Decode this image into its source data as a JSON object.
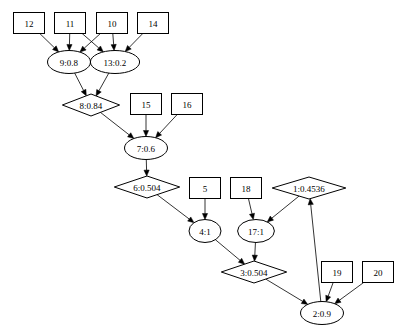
{
  "diagram": {
    "type": "directed-graph",
    "nodes": [
      {
        "id": "12",
        "label": "12",
        "shape": "box",
        "cx": 29,
        "cy": 23
      },
      {
        "id": "11",
        "label": "11",
        "shape": "box",
        "cx": 70,
        "cy": 23
      },
      {
        "id": "10",
        "label": "10",
        "shape": "box",
        "cx": 112,
        "cy": 23
      },
      {
        "id": "14",
        "label": "14",
        "shape": "box",
        "cx": 153,
        "cy": 23
      },
      {
        "id": "9",
        "label": "9:0.8",
        "shape": "ellipse",
        "cx": 69,
        "cy": 62
      },
      {
        "id": "13",
        "label": "13:0.2",
        "shape": "ellipse",
        "cx": 115,
        "cy": 62
      },
      {
        "id": "8",
        "label": "8:0.84",
        "shape": "diamond",
        "cx": 91,
        "cy": 105
      },
      {
        "id": "15",
        "label": "15",
        "shape": "box",
        "cx": 146,
        "cy": 104
      },
      {
        "id": "16",
        "label": "16",
        "shape": "box",
        "cx": 187,
        "cy": 104
      },
      {
        "id": "7",
        "label": "7:0.6",
        "shape": "ellipse",
        "cx": 146,
        "cy": 148
      },
      {
        "id": "6",
        "label": "6:0.504",
        "shape": "diamond",
        "cx": 147,
        "cy": 187
      },
      {
        "id": "5",
        "label": "5",
        "shape": "box",
        "cx": 205,
        "cy": 188
      },
      {
        "id": "18",
        "label": "18",
        "shape": "box",
        "cx": 246,
        "cy": 188
      },
      {
        "id": "1",
        "label": "1:0.4536",
        "shape": "diamond",
        "cx": 309,
        "cy": 188
      },
      {
        "id": "4",
        "label": "4:1",
        "shape": "ellipse",
        "cx": 205,
        "cy": 231
      },
      {
        "id": "17",
        "label": "17:1",
        "shape": "ellipse",
        "cx": 256,
        "cy": 231
      },
      {
        "id": "3",
        "label": "3:0.504",
        "shape": "diamond",
        "cx": 254,
        "cy": 272
      },
      {
        "id": "19",
        "label": "19",
        "shape": "box",
        "cx": 337,
        "cy": 272
      },
      {
        "id": "20",
        "label": "20",
        "shape": "box",
        "cx": 378,
        "cy": 272
      },
      {
        "id": "2",
        "label": "2:0.9",
        "shape": "ellipse",
        "cx": 322,
        "cy": 313
      }
    ],
    "edges": [
      {
        "from": "12",
        "to": "9"
      },
      {
        "from": "11",
        "to": "9"
      },
      {
        "from": "11",
        "to": "13"
      },
      {
        "from": "10",
        "to": "9"
      },
      {
        "from": "10",
        "to": "13"
      },
      {
        "from": "14",
        "to": "13"
      },
      {
        "from": "9",
        "to": "8"
      },
      {
        "from": "13",
        "to": "8"
      },
      {
        "from": "8",
        "to": "7"
      },
      {
        "from": "15",
        "to": "7"
      },
      {
        "from": "16",
        "to": "7"
      },
      {
        "from": "7",
        "to": "6"
      },
      {
        "from": "6",
        "to": "4"
      },
      {
        "from": "5",
        "to": "4"
      },
      {
        "from": "18",
        "to": "17"
      },
      {
        "from": "1",
        "to": "17"
      },
      {
        "from": "4",
        "to": "3"
      },
      {
        "from": "17",
        "to": "3"
      },
      {
        "from": "3",
        "to": "2"
      },
      {
        "from": "19",
        "to": "2"
      },
      {
        "from": "20",
        "to": "2"
      },
      {
        "from": "2",
        "to": "1"
      }
    ]
  },
  "colors": {
    "background": "#ffffff",
    "stroke": "#000000",
    "text": "#000000"
  }
}
